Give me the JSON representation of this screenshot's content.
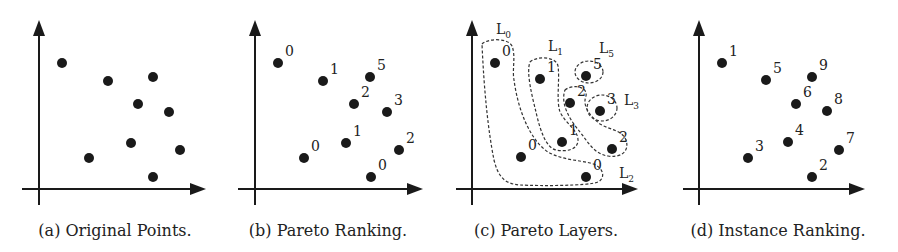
{
  "panels": [
    {
      "id": "a",
      "caption": "(a) Original Points.",
      "points": [
        {
          "x": 62,
          "y": 63,
          "label": ""
        },
        {
          "x": 108,
          "y": 81,
          "label": ""
        },
        {
          "x": 153,
          "y": 77,
          "label": ""
        },
        {
          "x": 138,
          "y": 104,
          "label": ""
        },
        {
          "x": 169,
          "y": 112,
          "label": ""
        },
        {
          "x": 131,
          "y": 143,
          "label": ""
        },
        {
          "x": 89,
          "y": 158,
          "label": ""
        },
        {
          "x": 180,
          "y": 150,
          "label": ""
        },
        {
          "x": 153,
          "y": 177,
          "label": ""
        }
      ]
    },
    {
      "id": "b",
      "caption": "(b) Pareto Ranking.",
      "points": [
        {
          "x": 278,
          "y": 63,
          "label": "0"
        },
        {
          "x": 323,
          "y": 81,
          "label": "1"
        },
        {
          "x": 370,
          "y": 77,
          "label": "5"
        },
        {
          "x": 354,
          "y": 104,
          "label": "2"
        },
        {
          "x": 387,
          "y": 112,
          "label": "3"
        },
        {
          "x": 346,
          "y": 143,
          "label": "1"
        },
        {
          "x": 304,
          "y": 158,
          "label": "0"
        },
        {
          "x": 399,
          "y": 150,
          "label": "2"
        },
        {
          "x": 371,
          "y": 177,
          "label": "0"
        }
      ]
    },
    {
      "id": "c",
      "caption": "(c) Pareto Layers.",
      "points": [
        {
          "x": 495,
          "y": 63,
          "label": "0"
        },
        {
          "x": 540,
          "y": 79,
          "label": "1"
        },
        {
          "x": 586,
          "y": 76,
          "label": "5"
        },
        {
          "x": 570,
          "y": 103,
          "label": "2"
        },
        {
          "x": 600,
          "y": 111,
          "label": "3"
        },
        {
          "x": 562,
          "y": 142,
          "label": "1"
        },
        {
          "x": 521,
          "y": 157,
          "label": "0"
        },
        {
          "x": 612,
          "y": 149,
          "label": "2"
        },
        {
          "x": 586,
          "y": 177,
          "label": "0"
        }
      ],
      "layers": [
        {
          "name": "L",
          "sub": "0"
        },
        {
          "name": "L",
          "sub": "1"
        },
        {
          "name": "L",
          "sub": "2"
        },
        {
          "name": "L",
          "sub": "3"
        },
        {
          "name": "L",
          "sub": "5"
        }
      ]
    },
    {
      "id": "d",
      "caption": "(d) Instance Ranking.",
      "points": [
        {
          "x": 722,
          "y": 63,
          "label": "1"
        },
        {
          "x": 766,
          "y": 80,
          "label": "5"
        },
        {
          "x": 812,
          "y": 77,
          "label": "9"
        },
        {
          "x": 796,
          "y": 104,
          "label": "6"
        },
        {
          "x": 827,
          "y": 111,
          "label": "8"
        },
        {
          "x": 788,
          "y": 142,
          "label": "4"
        },
        {
          "x": 748,
          "y": 158,
          "label": "3"
        },
        {
          "x": 839,
          "y": 150,
          "label": "7"
        },
        {
          "x": 812,
          "y": 177,
          "label": "2"
        }
      ]
    }
  ],
  "chart_data": [
    {
      "type": "scatter",
      "title": "(a) Original Points.",
      "x": [
        1.4,
        2.6,
        3.8,
        3.4,
        4.2,
        3.2,
        2.1,
        4.5,
        3.8
      ],
      "y": [
        6.6,
        5.9,
        6.0,
        5.0,
        4.7,
        3.5,
        2.9,
        3.2,
        2.1
      ],
      "labels": []
    },
    {
      "type": "scatter",
      "title": "(b) Pareto Ranking.",
      "labels": [
        "0",
        "1",
        "5",
        "2",
        "3",
        "1",
        "0",
        "2",
        "0"
      ]
    },
    {
      "type": "scatter",
      "title": "(c) Pareto Layers.",
      "labels": [
        "0",
        "1",
        "5",
        "2",
        "3",
        "1",
        "0",
        "2",
        "0"
      ],
      "layers": [
        "L0",
        "L1",
        "L2",
        "L3",
        "L5"
      ]
    },
    {
      "type": "scatter",
      "title": "(d) Instance Ranking.",
      "labels": [
        "1",
        "5",
        "9",
        "6",
        "8",
        "4",
        "3",
        "7",
        "2"
      ]
    }
  ]
}
